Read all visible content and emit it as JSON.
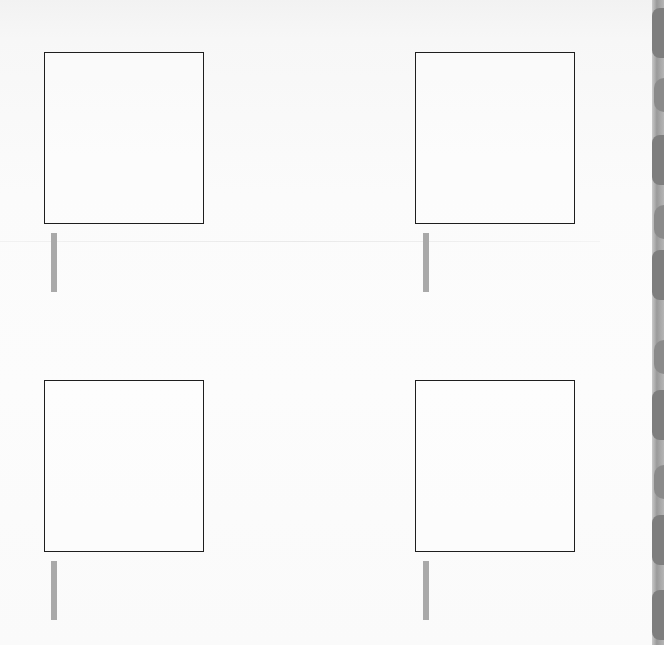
{
  "page": {
    "frames": [
      {
        "id": "top-left",
        "content": ""
      },
      {
        "id": "top-right",
        "content": ""
      },
      {
        "id": "bottom-left",
        "content": ""
      },
      {
        "id": "bottom-right",
        "content": ""
      }
    ],
    "colors": {
      "frame_border": "#1e1e1e",
      "bar": "#a9a9a9",
      "paper": "#fbfbfb",
      "binding_edge": "#9a9a9a"
    }
  }
}
